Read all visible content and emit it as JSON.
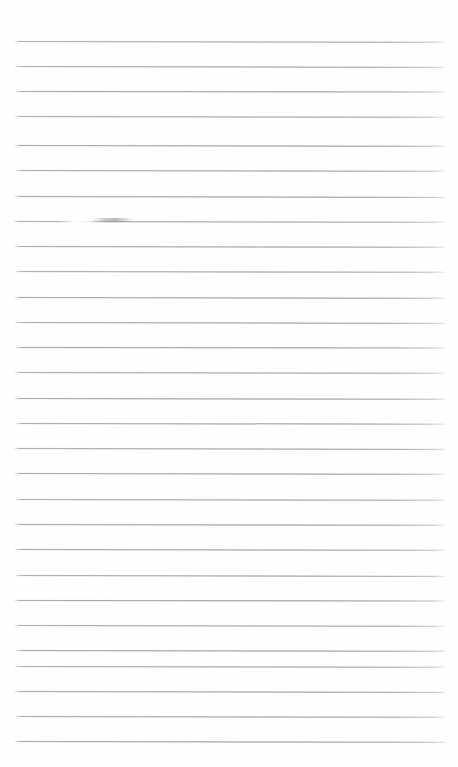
{
  "document": {
    "kind": "scanned-ruled-paper",
    "title": "Blank lined notebook page",
    "page_width": 458,
    "page_height": 767,
    "background_color": "#ffffff",
    "text_content": "",
    "has_handwriting": false,
    "has_printed_text": false,
    "has_page_number": false,
    "has_margin_rule": false
  },
  "ruling": {
    "line_color": "#94959a",
    "line_count": 29,
    "line_thickness_px": 1,
    "line_spacing_px": 25,
    "first_line_y": 41,
    "last_line_y": 741,
    "left_inset_px": 15,
    "right_inset_px": 14,
    "lines": [
      {
        "index": 1,
        "y": 41,
        "left": 15,
        "right": 444,
        "tilt_deg": 0.1,
        "opacity": 0.82
      },
      {
        "index": 2,
        "y": 66,
        "left": 15,
        "right": 444,
        "tilt_deg": 0.12,
        "opacity": 0.86
      },
      {
        "index": 3,
        "y": 91,
        "left": 16,
        "right": 445,
        "tilt_deg": 0.08,
        "opacity": 0.88
      },
      {
        "index": 4,
        "y": 116,
        "left": 15,
        "right": 444,
        "tilt_deg": 0.11,
        "opacity": 0.85
      },
      {
        "index": 5,
        "y": 145,
        "left": 15,
        "right": 445,
        "tilt_deg": 0.09,
        "opacity": 0.9
      },
      {
        "index": 6,
        "y": 170,
        "left": 16,
        "right": 444,
        "tilt_deg": 0.1,
        "opacity": 0.87
      },
      {
        "index": 7,
        "y": 196,
        "left": 15,
        "right": 445,
        "tilt_deg": 0.12,
        "opacity": 0.89
      },
      {
        "index": 8,
        "y": 221,
        "left": 14,
        "right": 444,
        "tilt_deg": 0.1,
        "opacity": 0.84
      },
      {
        "index": 9,
        "y": 246,
        "left": 15,
        "right": 445,
        "tilt_deg": 0.09,
        "opacity": 0.88
      },
      {
        "index": 10,
        "y": 271,
        "left": 16,
        "right": 444,
        "tilt_deg": 0.11,
        "opacity": 0.86
      },
      {
        "index": 11,
        "y": 297,
        "left": 15,
        "right": 445,
        "tilt_deg": 0.1,
        "opacity": 0.9
      },
      {
        "index": 12,
        "y": 322,
        "left": 15,
        "right": 444,
        "tilt_deg": 0.12,
        "opacity": 0.87
      },
      {
        "index": 13,
        "y": 347,
        "left": 16,
        "right": 445,
        "tilt_deg": 0.08,
        "opacity": 0.89
      },
      {
        "index": 14,
        "y": 372,
        "left": 15,
        "right": 444,
        "tilt_deg": 0.11,
        "opacity": 0.86
      },
      {
        "index": 15,
        "y": 398,
        "left": 15,
        "right": 445,
        "tilt_deg": 0.1,
        "opacity": 0.91
      },
      {
        "index": 16,
        "y": 423,
        "left": 16,
        "right": 444,
        "tilt_deg": 0.09,
        "opacity": 0.88
      },
      {
        "index": 17,
        "y": 448,
        "left": 15,
        "right": 445,
        "tilt_deg": 0.12,
        "opacity": 0.87
      },
      {
        "index": 18,
        "y": 473,
        "left": 15,
        "right": 444,
        "tilt_deg": 0.1,
        "opacity": 0.89
      },
      {
        "index": 19,
        "y": 499,
        "left": 16,
        "right": 445,
        "tilt_deg": 0.11,
        "opacity": 0.86
      },
      {
        "index": 20,
        "y": 524,
        "left": 15,
        "right": 444,
        "tilt_deg": 0.09,
        "opacity": 0.9
      },
      {
        "index": 21,
        "y": 549,
        "left": 15,
        "right": 445,
        "tilt_deg": 0.1,
        "opacity": 0.88
      },
      {
        "index": 22,
        "y": 575,
        "left": 16,
        "right": 444,
        "tilt_deg": 0.12,
        "opacity": 0.87
      },
      {
        "index": 23,
        "y": 600,
        "left": 15,
        "right": 445,
        "tilt_deg": 0.08,
        "opacity": 0.89
      },
      {
        "index": 24,
        "y": 625,
        "left": 15,
        "right": 444,
        "tilt_deg": 0.11,
        "opacity": 0.86
      },
      {
        "index": 25,
        "y": 650,
        "left": 16,
        "right": 445,
        "tilt_deg": 0.1,
        "opacity": 0.9
      },
      {
        "index": 26,
        "y": 666,
        "left": 15,
        "right": 444,
        "tilt_deg": 0.09,
        "opacity": 0.85
      },
      {
        "index": 27,
        "y": 691,
        "left": 15,
        "right": 445,
        "tilt_deg": 0.12,
        "opacity": 0.88
      },
      {
        "index": 28,
        "y": 716,
        "left": 16,
        "right": 444,
        "tilt_deg": 0.1,
        "opacity": 0.87
      },
      {
        "index": 29,
        "y": 741,
        "left": 15,
        "right": 445,
        "tilt_deg": 0.11,
        "opacity": 0.89
      }
    ]
  },
  "artifacts": [
    {
      "name": "line-break-highlight",
      "description": "pale washed-out gap where the rule fades out",
      "x": 58,
      "y": 218,
      "width": 46,
      "height": 5
    },
    {
      "name": "ink-smudge",
      "description": "faint dark smudge sitting on the eighth rule",
      "x": 92,
      "y": 218,
      "width": 42,
      "height": 4
    }
  ]
}
